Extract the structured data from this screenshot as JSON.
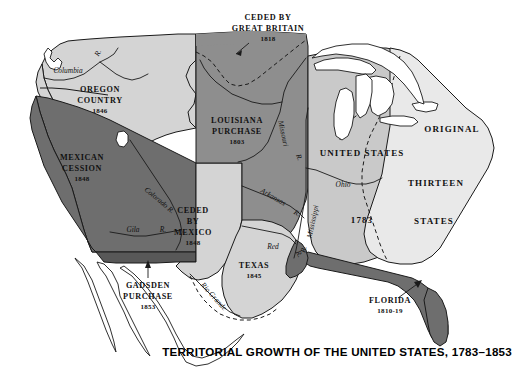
{
  "map": {
    "title": "TERRITORIAL GROWTH OF THE UNITED STATES, 1783–1853",
    "colors": {
      "ceded_great_britain": "#8e8e8e",
      "oregon_country": "#d4d4d4",
      "mexican_cession": "#6e6e6e",
      "gadsden_purchase": "#585858",
      "louisiana_purchase": "#8e8e8e",
      "ceded_by_mexico": "#d4d4d4",
      "texas": "#d4d4d4",
      "united_states_1783": "#c9c9c9",
      "original_thirteen": "#e9e9e9",
      "florida": "#6e6e6e",
      "water": "#ffffff",
      "outline": "#1a1a1a"
    },
    "territories": [
      {
        "id": "ceded-by-great-britain",
        "name_lines": [
          "CEDED BY",
          "GREAT BRITAIN"
        ],
        "year": "1818"
      },
      {
        "id": "oregon-country",
        "name_lines": [
          "OREGON",
          "COUNTRY"
        ],
        "year": "1846"
      },
      {
        "id": "louisiana-purchase",
        "name_lines": [
          "LOUISIANA",
          "PURCHASE"
        ],
        "year": "1803"
      },
      {
        "id": "mexican-cession",
        "name_lines": [
          "MEXICAN",
          "CESSION"
        ],
        "year": "1848"
      },
      {
        "id": "gadsden-purchase",
        "name_lines": [
          "GADSDEN",
          "PURCHASE"
        ],
        "year": "1853"
      },
      {
        "id": "ceded-by-mexico",
        "name_lines": [
          "CEDED",
          "BY",
          "MEXICO"
        ],
        "year": "1848"
      },
      {
        "id": "texas",
        "name_lines": [
          "TEXAS"
        ],
        "year": "1845"
      },
      {
        "id": "florida",
        "name_lines": [
          "FLORIDA"
        ],
        "year": "1810-19"
      },
      {
        "id": "united-states-1783",
        "name_lines": [
          "UNITED STATES"
        ],
        "year": "1783"
      },
      {
        "id": "original-thirteen-states",
        "name_lines": [
          "ORIGINAL",
          "THIRTEEN",
          "STATES"
        ],
        "year": ""
      }
    ],
    "labels": {
      "ceded_gb_line1": "CEDED BY",
      "ceded_gb_line2": "GREAT BRITAIN",
      "ceded_gb_year": "1818",
      "oregon_line1": "OREGON",
      "oregon_line2": "COUNTRY",
      "oregon_year": "1846",
      "louisiana_line1": "LOUISIANA",
      "louisiana_line2": "PURCHASE",
      "louisiana_year": "1803",
      "mexican_line1": "MEXICAN",
      "mexican_line2": "CESSION",
      "mexican_year": "1848",
      "gadsden_line1": "GADSDEN",
      "gadsden_line2": "PURCHASE",
      "gadsden_year": "1853",
      "ceded_mex_line1": "CEDED",
      "ceded_mex_line2": "BY",
      "ceded_mex_line3": "MEXICO",
      "ceded_mex_year": "1848",
      "texas_name": "TEXAS",
      "texas_year": "1845",
      "florida_name": "FLORIDA",
      "florida_year": "1810-19",
      "us_name": "UNITED STATES",
      "us_year": "1783",
      "original": "ORIGINAL",
      "thirteen": "THIRTEEN",
      "states": "STATES"
    },
    "rivers": [
      {
        "id": "columbia",
        "label": "Columbia"
      },
      {
        "id": "snake",
        "label": "R."
      },
      {
        "id": "colorado",
        "label": "Colorado R."
      },
      {
        "id": "gila",
        "label": "Gila"
      },
      {
        "id": "gila-r",
        "label": "R."
      },
      {
        "id": "missouri",
        "label": "Missouri"
      },
      {
        "id": "missouri-r",
        "label": "R."
      },
      {
        "id": "mississippi",
        "label": "Mississippi"
      },
      {
        "id": "mississippi-r",
        "label": "R."
      },
      {
        "id": "ohio",
        "label": "Ohio"
      },
      {
        "id": "arkansas",
        "label": "Arkansas"
      },
      {
        "id": "arkansas-r",
        "label": "R."
      },
      {
        "id": "red",
        "label": "Red"
      },
      {
        "id": "red-r",
        "label": "R."
      },
      {
        "id": "rio-grande",
        "label": "Rio Grande"
      }
    ],
    "river_labels": {
      "columbia": "Columbia",
      "snake_r": "R.",
      "colorado": "Colorado R.",
      "gila": "Gila",
      "gila_r": "R.",
      "missouri": "Missouri",
      "missouri_r": "R.",
      "mississippi": "Mississippi",
      "mississippi_r": "R.",
      "ohio": "Ohio",
      "arkansas": "Arkansas",
      "arkansas_r": "R.",
      "red": "Red",
      "red_r": "R.",
      "rio_grande": "Rio Grande"
    }
  }
}
